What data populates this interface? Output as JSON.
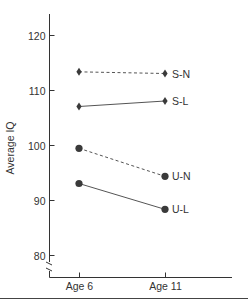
{
  "chart_data": {
    "type": "line",
    "title": "",
    "xlabel": "",
    "ylabel": "Average IQ",
    "categories": [
      "Age 6",
      "Age 11"
    ],
    "yticks": [
      80,
      90,
      100,
      110,
      120
    ],
    "ylim": [
      77,
      124
    ],
    "axis_break": true,
    "grid": false,
    "legend": "inline labels at right end of lines",
    "series": [
      {
        "name": "S-N",
        "values": [
          113.3,
          113.0
        ],
        "marker": "diamond",
        "line": "dashed"
      },
      {
        "name": "S-L",
        "values": [
          107.0,
          108.0
        ],
        "marker": "diamond",
        "line": "solid"
      },
      {
        "name": "U-N",
        "values": [
          99.4,
          94.3
        ],
        "marker": "circle",
        "line": "dashed"
      },
      {
        "name": "U-L",
        "values": [
          93.0,
          88.3
        ],
        "marker": "circle",
        "line": "solid"
      }
    ]
  },
  "colors": {
    "ink": "#333333",
    "marker": "#3a3a3a"
  }
}
